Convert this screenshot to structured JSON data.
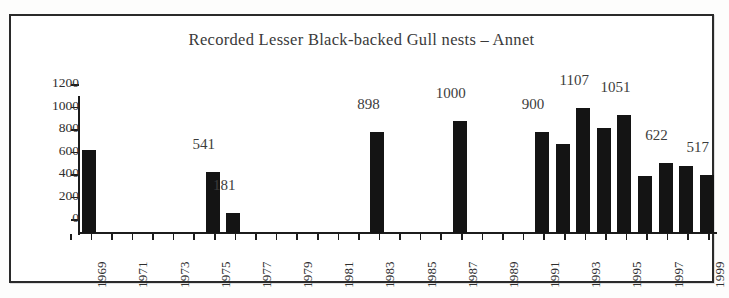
{
  "chart_data": {
    "type": "bar",
    "title": "Recorded Lesser Black-backed Gull nests – Annet",
    "xlabel": "",
    "ylabel": "",
    "ylim": [
      0,
      1200
    ],
    "ytick_labels": [
      "1200",
      "1000",
      "800",
      "600",
      "400",
      "200",
      "0"
    ],
    "ytick_values": [
      1200,
      1000,
      800,
      600,
      400,
      200,
      0
    ],
    "grid": false,
    "legend": false,
    "bar_color": "#141414",
    "categories": [
      "1969",
      "1970",
      "1971",
      "1972",
      "1973",
      "1974",
      "1975",
      "1976",
      "1977",
      "1978",
      "1979",
      "1980",
      "1981",
      "1982",
      "1983",
      "1984",
      "1985",
      "1986",
      "1987",
      "1988",
      "1989",
      "1990",
      "1991",
      "1992",
      "1993",
      "1994",
      "1995",
      "1996",
      "1997",
      "1998",
      "1999"
    ],
    "values": [
      740,
      0,
      0,
      0,
      0,
      0,
      541,
      181,
      0,
      0,
      0,
      0,
      0,
      0,
      898,
      0,
      0,
      0,
      1000,
      0,
      0,
      0,
      900,
      790,
      1107,
      930,
      1051,
      510,
      622,
      600,
      517
    ],
    "visible_xtick_labels": [
      "1969",
      "1971",
      "1973",
      "1975",
      "1977",
      "1979",
      "1981",
      "1983",
      "1985",
      "1987",
      "1989",
      "1991",
      "1993",
      "1995",
      "1997",
      "1999"
    ],
    "data_labels": [
      {
        "category": "1975",
        "text": "541",
        "value": 541
      },
      {
        "category": "1976",
        "text": "181",
        "value": 181
      },
      {
        "category": "1983",
        "text": "898",
        "value": 898
      },
      {
        "category": "1987",
        "text": "1000",
        "value": 1000
      },
      {
        "category": "1991",
        "text": "900",
        "value": 900
      },
      {
        "category": "1993",
        "text": "1107",
        "value": 1107
      },
      {
        "category": "1995",
        "text": "1051",
        "value": 1051
      },
      {
        "category": "1997",
        "text": "622",
        "value": 622
      },
      {
        "category": "1999",
        "text": "517",
        "value": 517
      }
    ]
  }
}
